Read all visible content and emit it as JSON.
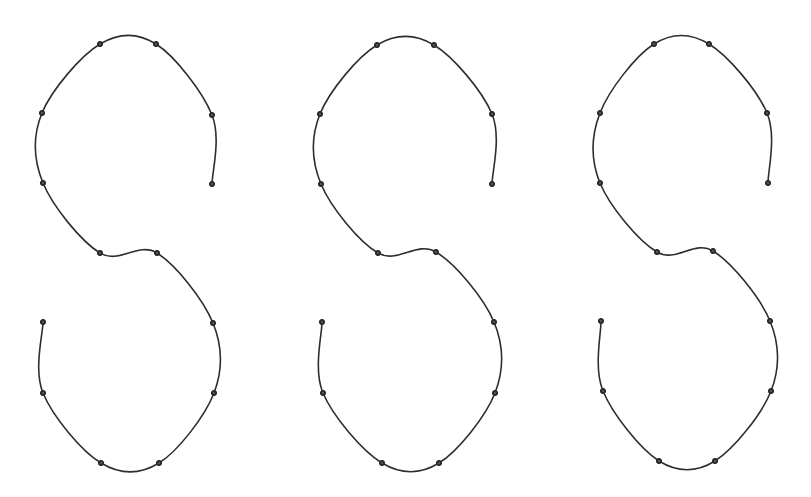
{
  "figure": {
    "width": 811,
    "height": 497,
    "background": "#ffffff",
    "stroke_color": "#2e2e2e",
    "knot_color": "#2a2a2a",
    "knot_radius": 2.6
  },
  "curves": [
    {
      "id": "s-curve-1",
      "points": [
        [
          212,
          184
        ],
        [
          212,
          115
        ],
        [
          156,
          44
        ],
        [
          100,
          44
        ],
        [
          42,
          113
        ],
        [
          43,
          183
        ],
        [
          100,
          253
        ],
        [
          157,
          253
        ],
        [
          213,
          323
        ],
        [
          214,
          393
        ],
        [
          159,
          463
        ],
        [
          101,
          463
        ],
        [
          43,
          393
        ],
        [
          43,
          322
        ]
      ]
    },
    {
      "id": "s-curve-2",
      "points": [
        [
          492,
          184
        ],
        [
          492,
          114
        ],
        [
          434,
          45
        ],
        [
          377,
          45
        ],
        [
          320,
          114
        ],
        [
          321,
          184
        ],
        [
          378,
          253
        ],
        [
          436,
          252
        ],
        [
          494,
          322
        ],
        [
          495,
          393
        ],
        [
          439,
          463
        ],
        [
          382,
          463
        ],
        [
          323,
          393
        ],
        [
          322,
          322
        ]
      ]
    },
    {
      "id": "s-curve-3",
      "points": [
        [
          768,
          183
        ],
        [
          767,
          113
        ],
        [
          709,
          44
        ],
        [
          654,
          44
        ],
        [
          600,
          113
        ],
        [
          600,
          183
        ],
        [
          657,
          252
        ],
        [
          713,
          251
        ],
        [
          770,
          321
        ],
        [
          771,
          391
        ],
        [
          715,
          461
        ],
        [
          659,
          461
        ],
        [
          603,
          391
        ],
        [
          601,
          321
        ]
      ]
    }
  ]
}
